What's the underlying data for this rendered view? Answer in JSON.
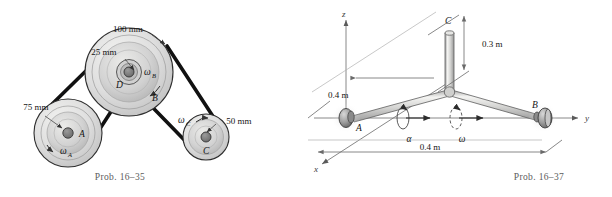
{
  "page": {
    "background_color": "#ffffff",
    "ink_color": "#141414",
    "caption_color": "#5c5c5c"
  },
  "figures": [
    {
      "id": "prob-16-35",
      "caption": "Prob. 16–35",
      "type": "belt-and-pulley-system",
      "labels": {
        "dim_pulley_b_outer": "100 mm",
        "dim_pulley_d_inner": "25 mm",
        "dim_pulley_a": "75 mm",
        "dim_pulley_c": "50 mm",
        "point_a": "A",
        "point_b": "B",
        "point_c": "C",
        "point_d": "D",
        "omega_a": "ω",
        "omega_a_sub": "A",
        "omega_b": "ω",
        "omega_b_sub": "B",
        "omega_c": "ω",
        "omega_c_sub": "C"
      },
      "geometry": {
        "pulley_a": {
          "cx": 68,
          "cy": 133,
          "r_outer": 34,
          "r_inner": 22,
          "r_hub": 5
        },
        "pulley_b": {
          "cx": 129,
          "cy": 72,
          "r_outer": 44,
          "r_inner": 34,
          "r_hub": 7
        },
        "pulley_d": {
          "cx": 129,
          "cy": 72,
          "r_outer": 13,
          "r_hub": 6
        },
        "pulley_c": {
          "cx": 206,
          "cy": 137,
          "r_outer": 23,
          "r_inner": 16,
          "r_hub": 5
        }
      }
    },
    {
      "id": "prob-16-37",
      "caption": "Prob. 16–37",
      "type": "rotating-shaft-3d",
      "labels": {
        "axis_z": "z",
        "axis_y": "y",
        "axis_x": "x",
        "point_a": "A",
        "point_b": "B",
        "point_c": "C",
        "dim_vertical": "0.3 m",
        "dim_depth": "0.4 m",
        "dim_length": "0.4 m",
        "alpha": "α",
        "omega": "ω"
      },
      "geometry": {
        "origin_a": {
          "x": 40,
          "y": 118
        },
        "bearing_b": {
          "x": 232,
          "y": 118
        },
        "joint": {
          "x": 143,
          "y": 92
        },
        "top_c": {
          "x": 143,
          "y": 33
        }
      }
    }
  ]
}
